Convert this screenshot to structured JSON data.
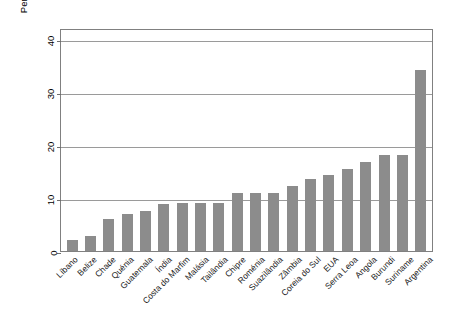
{
  "chart_data": {
    "type": "bar",
    "title": "",
    "xlabel": "",
    "ylabel": "Percentual de mulheres no parlamento",
    "ylabel_line1": "Percentual de mulheres",
    "ylabel_line2": "no parlamento",
    "ylim": [
      0,
      42
    ],
    "yticks": [
      0,
      10,
      20,
      30,
      40
    ],
    "ytick_labels": [
      "0",
      "10",
      "20",
      "30",
      "40"
    ],
    "grid": "horizontal",
    "legend": "none",
    "bar_color": "#8c8c8c",
    "axis_color": "#808080",
    "categories": [
      "Líbano",
      "Belize",
      "Chade",
      "Quénia",
      "Guatemala",
      "Índia",
      "Costa do Marfim",
      "Malásia",
      "Tailândia",
      "Chipre",
      "Roménia",
      "Suazilândia",
      "Zâmbia",
      "Coreia do Sul",
      "EUA",
      "Serra Leoa",
      "Angola",
      "Burundi",
      "Suriname",
      "Argentina"
    ],
    "values": [
      2.0,
      2.8,
      6.0,
      7.0,
      7.5,
      8.8,
      9.0,
      9.0,
      9.0,
      11.0,
      11.0,
      11.0,
      12.2,
      13.5,
      14.3,
      15.5,
      16.7,
      18.0,
      18.0,
      34.0
    ]
  }
}
